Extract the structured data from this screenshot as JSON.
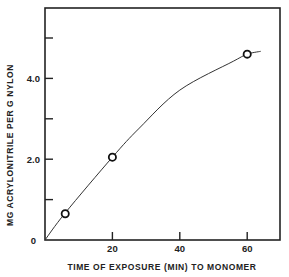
{
  "chart_data": {
    "type": "line",
    "title": "",
    "xlabel": "TIME OF EXPOSURE (MIN) TO MONOMER",
    "ylabel": "MG ACRYLONITRILE PER G NYLON",
    "xlim": [
      0,
      70
    ],
    "ylim": [
      0,
      5.75
    ],
    "grid": false,
    "legend": null,
    "x_ticks": [
      {
        "value": 20,
        "label": "20"
      },
      {
        "value": 40,
        "label": "40"
      },
      {
        "value": 60,
        "label": "60"
      }
    ],
    "y_ticks": [
      {
        "value": 0,
        "label": "0"
      },
      {
        "value": 1,
        "label": ""
      },
      {
        "value": 2,
        "label": "2.0"
      },
      {
        "value": 3,
        "label": ""
      },
      {
        "value": 4,
        "label": "4.0"
      },
      {
        "value": 5,
        "label": ""
      }
    ],
    "series": [
      {
        "name": "measured",
        "marker": "open-circle",
        "x": [
          6,
          20,
          60
        ],
        "y": [
          0.65,
          2.05,
          4.6
        ]
      },
      {
        "name": "fitted-curve",
        "marker": "none",
        "x": [
          0,
          6,
          20,
          28,
          40,
          56,
          60,
          64
        ],
        "y": [
          0,
          0.67,
          2.05,
          2.77,
          3.71,
          4.43,
          4.6,
          4.67
        ]
      }
    ],
    "colors": {
      "line": "#333333",
      "axis": "#222222",
      "marker": "#111111"
    }
  }
}
